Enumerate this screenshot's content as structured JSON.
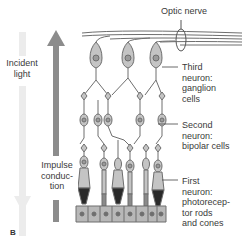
{
  "labels": {
    "optic_nerve": "Optic nerve",
    "incident_light_1": "Incident",
    "incident_light_2": "light",
    "impulse_1": "Impulse",
    "impulse_2": "conduc-",
    "impulse_3": "tion",
    "third_1": "Third",
    "third_2": "neuron:",
    "third_3": "ganglion",
    "third_4": "cells",
    "second_1": "Second",
    "second_2": "neuron:",
    "second_3": "bipolar cells",
    "first_1": "First",
    "first_2": "neuron:",
    "first_3": "photorecep-",
    "first_4": "tor rods",
    "first_5": "and cones",
    "panel": "B"
  },
  "colors": {
    "cell_fill": "#c4c4c4",
    "cell_stroke": "#6e6e6e",
    "nucleus": "#9a9a9a",
    "light_arrow": "#e8e8e8",
    "impulse_arrow": "#8c8c8c",
    "outer_segment": "#2a2a2a"
  }
}
